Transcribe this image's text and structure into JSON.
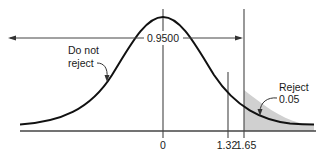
{
  "diagram": {
    "type": "normal-distribution-one-tailed-test",
    "center_label": "0.9500",
    "left_region_label_line1": "Do not",
    "left_region_label_line2": "reject",
    "right_region_label_line1": "Reject",
    "right_region_label_line2": "0.05",
    "tick_labels": [
      "0",
      "1.32",
      "1.65"
    ],
    "colors": {
      "curve": "#111111",
      "axis": "#444444",
      "shade": "#d0d0d0",
      "background": "#ffffff"
    }
  }
}
